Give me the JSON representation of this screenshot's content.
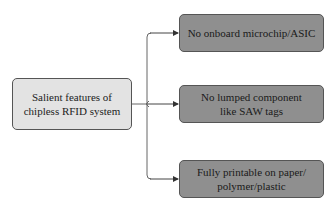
{
  "diagram": {
    "root": {
      "label": "Salient features of chipless RFID system"
    },
    "children": [
      {
        "label": "No onboard microchip/ASIC"
      },
      {
        "label": "No lumped component like SAW tags"
      },
      {
        "label": "Fully printable on paper/ polymer/plastic"
      }
    ],
    "colors": {
      "root_fill": "#e3e3e3",
      "leaf_fill": "#8f8f8f",
      "stroke": "#555555"
    }
  }
}
